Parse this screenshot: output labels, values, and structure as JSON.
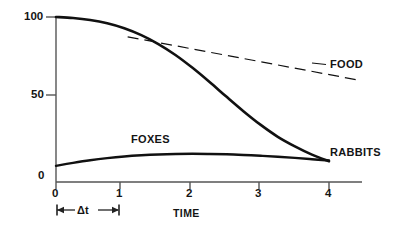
{
  "chart_data": {
    "type": "line",
    "title": "",
    "subtitle": "",
    "xlabel": "TIME",
    "ylabel": "",
    "xlim": [
      0,
      4.4
    ],
    "ylim": [
      0,
      105
    ],
    "grid": false,
    "legend": "inline-end-labels",
    "x_ticks": [
      "0",
      "1",
      "2",
      "3",
      "4"
    ],
    "x_tick_values": [
      0,
      1,
      2,
      3,
      4
    ],
    "y_ticks": [
      "0",
      "50",
      "100"
    ],
    "y_tick_values": [
      0,
      50,
      100
    ],
    "series": [
      {
        "name": "RABBITS",
        "style": "solid-thick",
        "color": "#111111",
        "x": [
          0,
          0.25,
          0.5,
          0.75,
          1.0,
          1.25,
          1.5,
          1.75,
          2.0,
          2.25,
          2.5,
          2.75,
          3.0,
          3.25,
          3.5,
          3.75,
          4.0
        ],
        "values": [
          100,
          99.4,
          98.2,
          96.2,
          93.2,
          89.0,
          83.6,
          77.0,
          69.2,
          60.6,
          51.6,
          42.8,
          34.6,
          27.4,
          21.6,
          16.6,
          12.6
        ]
      },
      {
        "name": "FOXES",
        "style": "solid-thick",
        "color": "#111111",
        "x": [
          0,
          0.25,
          0.5,
          0.75,
          1.0,
          1.25,
          1.5,
          1.75,
          2.0,
          2.25,
          2.5,
          2.75,
          3.0,
          3.25,
          3.5,
          3.75,
          4.0
        ],
        "values": [
          9.8,
          11.6,
          13.2,
          14.5,
          15.5,
          16.2,
          16.7,
          17.0,
          17.1,
          17.0,
          16.8,
          16.4,
          15.9,
          15.3,
          14.6,
          13.8,
          13.0
        ]
      },
      {
        "name": "FOOD",
        "style": "dashed-thin",
        "color": "#111111",
        "x": [
          1.05,
          4.4
        ],
        "values": [
          88,
          62
        ]
      }
    ],
    "annotations": [
      {
        "name": "delta-t-span",
        "label": "Δt",
        "from_x": 0,
        "to_x": 1,
        "type": "double-headed-arrow"
      }
    ]
  },
  "labels": {
    "y_100": "100",
    "y_50": "50",
    "y_0": "0",
    "x_0": "0",
    "x_1": "1",
    "x_2": "2",
    "x_3": "3",
    "x_4": "4",
    "food": "FOOD",
    "rabbits": "RABBITS",
    "foxes": "FOXES",
    "time": "TIME",
    "delta_t": "Δt"
  },
  "colors": {
    "ink": "#111111",
    "axis": "#555555",
    "background": "#ffffff"
  }
}
